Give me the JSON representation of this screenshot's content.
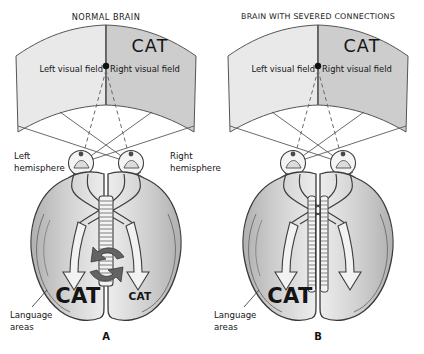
{
  "figure": {
    "width": 424,
    "height": 354,
    "background": "#ffffff"
  },
  "colors": {
    "field_left": "#e8e8e8",
    "field_right": "#c9c9c9",
    "brain_fill": "#c6c6c6",
    "brain_light": "#e4e4e4",
    "outline": "#3b3b3b",
    "arrow_dark": "#5e5e5e",
    "text": "#141414",
    "callosum": "#f2f2f2"
  },
  "panels": [
    {
      "id": "A",
      "letter": "A",
      "title": "NORMAL BRAIN",
      "stimulus_word": "CAT",
      "visual_field_left_label": "Left visual field",
      "visual_field_right_label": "Right visual field",
      "fixation_point": "fixation-dot",
      "hemisphere_left_label_line1": "Left",
      "hemisphere_left_label_line2": "hemisphere",
      "hemisphere_right_label_line1": "Right",
      "hemisphere_right_label_line2": "hemisphere",
      "language_label_line1": "Language",
      "language_label_line2": "areas",
      "spoken_word_left": "CAT",
      "spoken_word_right": "CAT",
      "corpus_callosum": "intact",
      "transfer_arrows": 2
    },
    {
      "id": "B",
      "letter": "B",
      "title": "BRAIN WITH SEVERED CONNECTIONS",
      "stimulus_word": "CAT",
      "visual_field_left_label": "Left visual field",
      "visual_field_right_label": "Right visual field",
      "fixation_point": "fixation-dot",
      "hemisphere_left_label_line1": "",
      "hemisphere_left_label_line2": "",
      "hemisphere_right_label_line1": "",
      "hemisphere_right_label_line2": "",
      "language_label_line1": "Language",
      "language_label_line2": "areas",
      "spoken_word_left": "CAT",
      "spoken_word_right": "",
      "corpus_callosum": "severed",
      "transfer_arrows": 0
    }
  ]
}
